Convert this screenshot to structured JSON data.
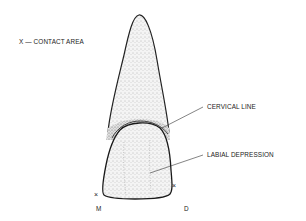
{
  "figure": {
    "legend": "X — CONTACT AREA",
    "labels": {
      "cervical_line": "CERVICAL LINE",
      "labial_depression": "LABIAL DEPRESSION"
    },
    "markers": {
      "contact_mark": "×",
      "mesial": "M",
      "distal": "D"
    }
  }
}
